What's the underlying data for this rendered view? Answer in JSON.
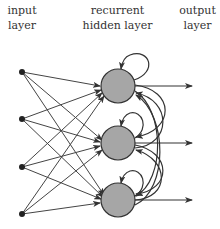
{
  "labels": {
    "input": [
      "input",
      "layer"
    ],
    "hidden": [
      "recurrent",
      "hidden layer"
    ],
    "output": [
      "output",
      "layer"
    ]
  },
  "colors": {
    "node_fill": "#a6a6a6",
    "stroke": "#333333",
    "text": "#333333"
  },
  "network": {
    "input_nodes": 4,
    "hidden_nodes": 3,
    "output_arrows": 3
  }
}
